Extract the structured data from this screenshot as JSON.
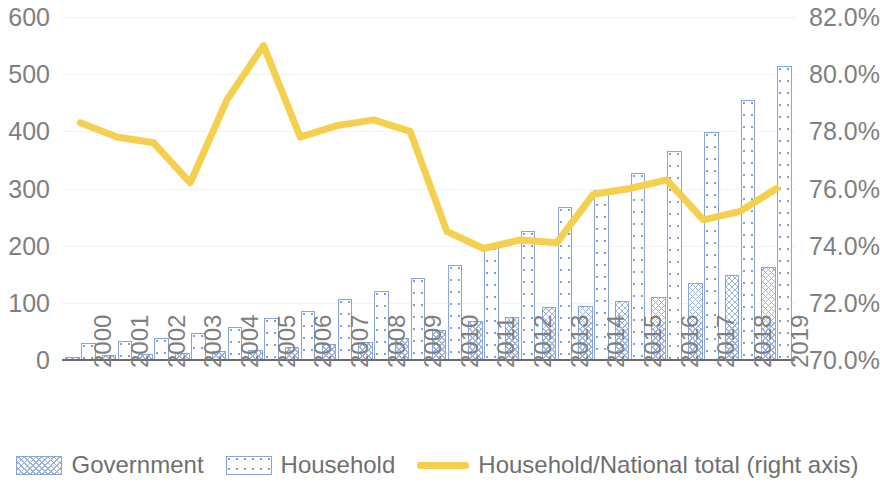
{
  "chart_data": {
    "type": "bar",
    "title": "",
    "subtitle": "",
    "xlabel": "",
    "ylabel": "",
    "categories": [
      "2000",
      "2001",
      "2002",
      "2003",
      "2004",
      "2005",
      "2006",
      "2007",
      "2008",
      "2009",
      "2010",
      "2011",
      "2012",
      "2013",
      "2014",
      "2015",
      "2016",
      "2017",
      "2018",
      "2019"
    ],
    "series": [
      {
        "name": "Government",
        "axis": "left",
        "kind": "bar",
        "color": "#9db4dd",
        "pattern": "cross-hatch",
        "values": [
          6,
          9,
          11,
          13,
          15,
          18,
          22,
          28,
          31,
          39,
          53,
          69,
          76,
          92,
          94,
          103,
          111,
          135,
          149,
          163
        ]
      },
      {
        "name": "Household",
        "axis": "left",
        "kind": "bar",
        "color": "#7f9ed4",
        "pattern": "dotted",
        "values": [
          29,
          33,
          38,
          47,
          58,
          73,
          85,
          106,
          120,
          144,
          167,
          199,
          225,
          267,
          298,
          328,
          365,
          399,
          455,
          515
        ]
      },
      {
        "name": "Household/National total (right axis)",
        "axis": "right",
        "kind": "line",
        "color": "#f5d04f",
        "values": [
          78.3,
          77.8,
          77.6,
          76.2,
          79.1,
          81.0,
          77.8,
          78.2,
          78.4,
          78.0,
          74.5,
          73.9,
          74.2,
          74.1,
          75.8,
          76.0,
          76.3,
          74.9,
          75.2,
          76.0
        ]
      }
    ],
    "left_axis": {
      "min": 0,
      "max": 600,
      "step": 100,
      "ticks": [
        "0",
        "100",
        "200",
        "300",
        "400",
        "500",
        "600"
      ]
    },
    "right_axis": {
      "min": 70.0,
      "max": 82.0,
      "step": 2.0,
      "ticks": [
        "70.0%",
        "72.0%",
        "74.0%",
        "76.0%",
        "78.0%",
        "80.0%",
        "82.0%"
      ]
    },
    "grid": true,
    "legend_position": "bottom"
  },
  "legend": {
    "government_label": "Government",
    "household_label": "Household",
    "ratio_label": "Household/National total (right axis)"
  },
  "colors": {
    "bar_outline": "#8aa3d8",
    "government": "#9db4dd",
    "household": "#7f9ed4",
    "line": "#f5d04f",
    "axis_text": "#7f7f7f",
    "gridline": "#f2f2f2",
    "baseline": "#6b6b6b"
  }
}
